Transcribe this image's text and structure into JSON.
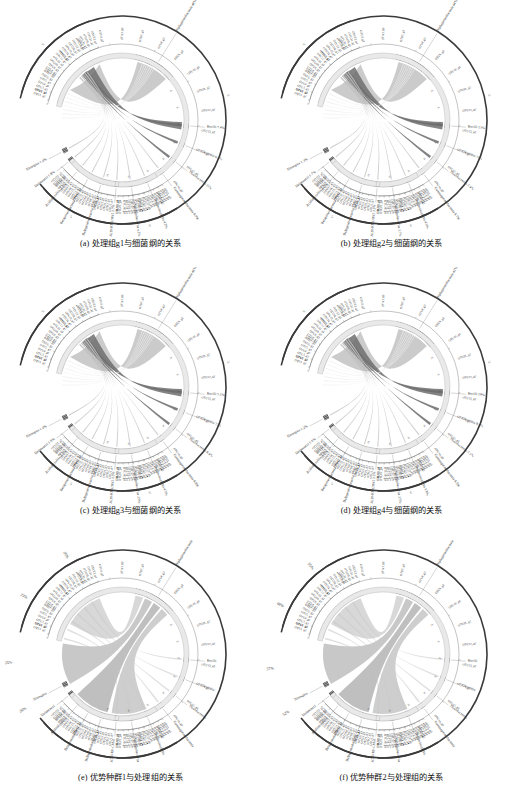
{
  "figure": {
    "title_present": false,
    "panel_count": 6
  },
  "panels": [
    {
      "id": "a",
      "caption": "(a) 处理组g1与细菌纲的关系",
      "outer_labels": [
        {
          "name": "Alphaproteobacteria",
          "pct": "48%",
          "text": "Alphaproteobacteria 48%",
          "angle": -58
        },
        {
          "name": "Bacilli",
          "pct": "7.4%",
          "text": "Bacilli 7.4%",
          "angle": 5
        },
        {
          "name": "Clostridia",
          "pct": "6.5%",
          "text": "Clostridia 6.5%",
          "angle": 22
        },
        {
          "name": "Flavobacteriia",
          "pct": "11%",
          "text": "Flavobacteriia 11%",
          "angle": 38
        },
        {
          "name": "Gammaproteobacteria",
          "pct": "4.9%",
          "text": "Gammaproteobacteria 4.9%",
          "angle": 53
        },
        {
          "name": "Thermoleophilia",
          "pct": "4.2%",
          "text": "Thermoleophilia 4.2%",
          "angle": 68
        },
        {
          "name": "Sphingobacteriia",
          "pct": "4.2%",
          "text": "Sphingobacteriia 4.2%",
          "angle": 82
        },
        {
          "name": "JG30_KF_CM45",
          "pct": "3.7%",
          "text": "JG30-KF-CM45 3.7%",
          "angle": 95
        },
        {
          "name": "Deltaproteobacteria",
          "pct": "3.1%",
          "text": "Deltaproteobacteria 3.1%",
          "angle": 108
        },
        {
          "name": "Betaproteobacteria",
          "pct": "2.2%",
          "text": "Betaproteobacteria 2.2%",
          "angle": 120
        },
        {
          "name": "Acidimicrobiia",
          "pct": "2.1%",
          "text": "Acidimicrobiia 2.1%",
          "angle": 131
        },
        {
          "name": "Deinococci",
          "pct": "1.8%",
          "text": "Deinococci 1.8%",
          "angle": 142
        },
        {
          "name": "Nitrospira",
          "pct": "1.4%",
          "text": "Nitrospira 1.4%",
          "angle": 152
        }
      ],
      "axis_ticks": [
        "2k",
        "4k",
        "6k",
        "8k",
        "0k",
        "2k",
        "4k",
        "6k"
      ],
      "sector_label": "g1",
      "highlight": "Alphaproteobacteria"
    },
    {
      "id": "b",
      "caption": "(b) 处理组g2与细菌纲的关系",
      "outer_labels": [
        {
          "name": "Alphaproteobacteria",
          "pct": "44%",
          "text": "Alphaproteobacteria 44%",
          "angle": -58
        },
        {
          "name": "Bacilli",
          "pct": "13%",
          "text": "Bacilli 13%",
          "angle": 5
        },
        {
          "name": "Clostridia",
          "pct": "10%",
          "text": "Clostridia 10%",
          "angle": 22
        },
        {
          "name": "Flavobacteriia",
          "pct": "7.4%",
          "text": "Flavobacteriia 7.4%",
          "angle": 38
        },
        {
          "name": "Gammaproteobacteria",
          "pct": "4.7%",
          "text": "Gammaproteobacteria 4.7%",
          "angle": 53
        },
        {
          "name": "Thermoleophilia",
          "pct": "4.0%",
          "text": "Thermoleophilia 4.0%",
          "angle": 68
        },
        {
          "name": "Sphingobacteriia",
          "pct": "3.7%",
          "text": "Sphingobacteriia 3.7%",
          "angle": 82
        },
        {
          "name": "JG30_KF_CM45",
          "pct": "3.2%",
          "text": "JG30-KF-CM45 3.2%",
          "angle": 95
        },
        {
          "name": "Deltaproteobacteria",
          "pct": "2.8%",
          "text": "Deltaproteobacteria 2.8%",
          "angle": 108
        },
        {
          "name": "Betaproteobacteria",
          "pct": "2.3%",
          "text": "Betaproteobacteria 2.3%",
          "angle": 120
        },
        {
          "name": "Acidimicrobiia",
          "pct": "2.0%",
          "text": "Acidimicrobiia 2.0%",
          "angle": 131
        },
        {
          "name": "Deinococci",
          "pct": "1.7%",
          "text": "Deinococci 1.7%",
          "angle": 142
        },
        {
          "name": "Nitrospira",
          "pct": "1.3%",
          "text": "Nitrospira 1.3%",
          "angle": 152
        }
      ],
      "axis_ticks": [
        "2k",
        "4k",
        "6k",
        "8k",
        "0k",
        "2k",
        "4k",
        "6k"
      ],
      "sector_label": "g2",
      "highlight": "Alphaproteobacteria"
    },
    {
      "id": "c",
      "caption": "(c) 处理组g3与细菌纲的关系",
      "outer_labels": [
        {
          "name": "Alphaproteobacteria",
          "pct": "46%",
          "text": "Alphaproteobacteria 46%",
          "angle": -58
        },
        {
          "name": "Bacilli",
          "pct": "5.1%",
          "text": "Bacilli 5.1%",
          "angle": 5
        },
        {
          "name": "Clostridia",
          "pct": "12%",
          "text": "Clostridia 12%",
          "angle": 22
        },
        {
          "name": "Flavobacteriia",
          "pct": "8.4%",
          "text": "Flavobacteriia 8.4%",
          "angle": 38
        },
        {
          "name": "Gammaproteobacteria",
          "pct": "4.8%",
          "text": "Gammaproteobacteria 4.8%",
          "angle": 53
        },
        {
          "name": "Thermoleophilia",
          "pct": "4.3%",
          "text": "Thermoleophilia 4.3%",
          "angle": 68
        },
        {
          "name": "Sphingobacteriia",
          "pct": "3.9%",
          "text": "Sphingobacteriia 3.9%",
          "angle": 82
        },
        {
          "name": "JG30_KF_CM45",
          "pct": "3.5%",
          "text": "JG30-KF-CM45 3.5%",
          "angle": 95
        },
        {
          "name": "Deltaproteobacteria",
          "pct": "3.0%",
          "text": "Deltaproteobacteria 3.0%",
          "angle": 108
        },
        {
          "name": "Betaproteobacteria",
          "pct": "2.4%",
          "text": "Betaproteobacteria 2.4%",
          "angle": 120
        },
        {
          "name": "Acidimicrobiia",
          "pct": "2.1%",
          "text": "Acidimicrobiia 2.1%",
          "angle": 131
        },
        {
          "name": "Deinococci",
          "pct": "1.9%",
          "text": "Deinococci 1.9%",
          "angle": 142
        },
        {
          "name": "Nitrospira",
          "pct": "1.4%",
          "text": "Nitrospira 1.4%",
          "angle": 152
        }
      ],
      "axis_ticks": [
        "2k",
        "4k",
        "6k",
        "8k",
        "0k",
        "2k",
        "4k",
        "6k"
      ],
      "sector_label": "g3",
      "highlight": "Alphaproteobacteria"
    },
    {
      "id": "d",
      "caption": "(d) 处理组g4与细菌纲的关系",
      "outer_labels": [
        {
          "name": "Alphaproteobacteria",
          "pct": "42%",
          "text": "Alphaproteobacteria 42%",
          "angle": -58
        },
        {
          "name": "Bacilli",
          "pct": "19%",
          "text": "Bacilli 19%",
          "angle": 5
        },
        {
          "name": "Clostridia",
          "pct": "8.4%",
          "text": "Clostridia 8.4%",
          "angle": 22
        },
        {
          "name": "Flavobacteriia",
          "pct": "7.1%",
          "text": "Flavobacteriia 7.1%",
          "angle": 38
        },
        {
          "name": "Gammaproteobacteria",
          "pct": "4.5%",
          "text": "Gammaproteobacteria 4.5%",
          "angle": 53
        },
        {
          "name": "Thermoleophilia",
          "pct": "3.8%",
          "text": "Thermoleophilia 3.8%",
          "angle": 68
        },
        {
          "name": "Sphingobacteriia",
          "pct": "3.5%",
          "text": "Sphingobacteriia 3.5%",
          "angle": 82
        },
        {
          "name": "JG30_KF_CM45",
          "pct": "3.1%",
          "text": "JG30-KF-CM45 3.1%",
          "angle": 95
        },
        {
          "name": "Deltaproteobacteria",
          "pct": "2.7%",
          "text": "Deltaproteobacteria 2.7%",
          "angle": 108
        },
        {
          "name": "Betaproteobacteria",
          "pct": "2.2%",
          "text": "Betaproteobacteria 2.2%",
          "angle": 120
        },
        {
          "name": "Acidimicrobiia",
          "pct": "1.9%",
          "text": "Acidimicrobiia 1.9%",
          "angle": 131
        },
        {
          "name": "Deinococci",
          "pct": "1.6%",
          "text": "Deinococci 1.6%",
          "angle": 142
        },
        {
          "name": "Nitrospira",
          "pct": "1.2%",
          "text": "Nitrospira 1.2%",
          "angle": 152
        }
      ],
      "axis_ticks": [
        "2k",
        "4k",
        "6k",
        "8k",
        "0k",
        "2k",
        "4k",
        "6k"
      ],
      "sector_label": "g4",
      "highlight": "Bacilli"
    },
    {
      "id": "e",
      "caption": "(e) 优势种群1与处理组的关系",
      "outer_labels": [
        {
          "name": "Alphaproteobacteria",
          "pct": "",
          "text": "Alphaproteobacteria",
          "angle": -58
        },
        {
          "name": "Bacilli",
          "pct": "",
          "text": "Bacilli",
          "angle": 5
        },
        {
          "name": "Clostridia",
          "pct": "",
          "text": "Clostridia",
          "angle": 22
        },
        {
          "name": "Flavobacteriia",
          "pct": "",
          "text": "Flavobacteriia",
          "angle": 38
        },
        {
          "name": "Gammaproteobacteria",
          "pct": "",
          "text": "Gammaproteobacteria",
          "angle": 53
        },
        {
          "name": "Thermoleophilia",
          "pct": "",
          "text": "Thermoleophilia",
          "angle": 68
        },
        {
          "name": "Sphingobacteriia",
          "pct": "",
          "text": "Sphingobacteriia",
          "angle": 82
        },
        {
          "name": "JG30_KF_CM45",
          "pct": "",
          "text": "JG30-KF-CM45",
          "angle": 95
        },
        {
          "name": "Deltaproteobacteria",
          "pct": "",
          "text": "Deltaproteobacteria",
          "angle": 108
        },
        {
          "name": "Betaproteobacteria",
          "pct": "",
          "text": "Betaproteobacteria",
          "angle": 120
        },
        {
          "name": "Acidimicrobiia",
          "pct": "",
          "text": "Acidimicrobiia",
          "angle": 131
        },
        {
          "name": "Deinococci",
          "pct": "",
          "text": "Deinococci",
          "angle": 142
        },
        {
          "name": "Nitrospira",
          "pct": "",
          "text": "Nitrospira",
          "angle": 152
        }
      ],
      "group_pcts": [
        {
          "label": "26%",
          "angle": -120
        },
        {
          "label": "23%",
          "angle": -150
        },
        {
          "label": "25%",
          "angle": 175
        },
        {
          "label": "26%",
          "angle": 150
        }
      ],
      "axis_ticks": [
        "2k",
        "4k",
        "6k",
        "8k",
        "0k",
        "2k",
        "4k",
        "6k"
      ],
      "sector_label": "",
      "highlight": "Alphaproteobacteria"
    },
    {
      "id": "f",
      "caption": "(f) 优势种群2与处理组的关系",
      "outer_labels": [
        {
          "name": "Alphaproteobacteria",
          "pct": "",
          "text": "Alphaproteobacteria",
          "angle": -58
        },
        {
          "name": "Bacilli",
          "pct": "",
          "text": "Bacilli",
          "angle": 5
        },
        {
          "name": "Clostridia",
          "pct": "",
          "text": "Clostridia",
          "angle": 22
        },
        {
          "name": "Flavobacteriia",
          "pct": "",
          "text": "Flavobacteriia",
          "angle": 38
        },
        {
          "name": "Gammaproteobacteria",
          "pct": "",
          "text": "Gammaproteobacteria",
          "angle": 53
        },
        {
          "name": "Thermoleophilia",
          "pct": "",
          "text": "Thermoleophilia",
          "angle": 68
        },
        {
          "name": "Sphingobacteriia",
          "pct": "",
          "text": "Sphingobacteriia",
          "angle": 82
        },
        {
          "name": "JG30_KF_CM45",
          "pct": "",
          "text": "JG30-KF-CM45",
          "angle": 95
        },
        {
          "name": "Deltaproteobacteria",
          "pct": "",
          "text": "Deltaproteobacteria",
          "angle": 108
        },
        {
          "name": "Betaproteobacteria",
          "pct": "",
          "text": "Betaproteobacteria",
          "angle": 120
        },
        {
          "name": "Acidimicrobiia",
          "pct": "",
          "text": "Acidimicrobiia",
          "angle": 131
        },
        {
          "name": "Deinococci",
          "pct": "",
          "text": "Deinococci",
          "angle": 142
        },
        {
          "name": "Nitrospira",
          "pct": "",
          "text": "Nitrospira",
          "angle": 152
        }
      ],
      "group_pcts": [
        {
          "label": "55%",
          "angle": -130
        },
        {
          "label": "60%",
          "angle": -155
        },
        {
          "label": "57%",
          "angle": 172
        },
        {
          "label": "52%",
          "angle": 148
        }
      ],
      "axis_ticks": [
        "2k",
        "4k",
        "6k",
        "8k",
        "0k",
        "2k",
        "4k",
        "6k"
      ],
      "sector_label": "",
      "highlight": "Alphaproteobacteria"
    }
  ],
  "chart_data": {
    "type": "chord",
    "title": "",
    "categories": [
      "Alphaproteobacteria",
      "Bacilli",
      "Clostridia",
      "Flavobacteriia",
      "Gammaproteobacteria",
      "Thermoleophilia",
      "Sphingobacteriia",
      "JG30-KF-CM45",
      "Deltaproteobacteria",
      "Betaproteobacteria",
      "Acidimicrobiia",
      "Deinococci",
      "Nitrospira"
    ],
    "series": [
      {
        "name": "g1",
        "values": [
          48,
          7.4,
          6.5,
          11,
          4.9,
          4.2,
          4.2,
          3.7,
          3.1,
          2.2,
          2.1,
          1.8,
          1.4
        ]
      },
      {
        "name": "g2",
        "values": [
          44,
          13,
          10,
          7.4,
          4.7,
          4.0,
          3.7,
          3.2,
          2.8,
          2.3,
          2.0,
          1.7,
          1.3
        ]
      },
      {
        "name": "g3",
        "values": [
          46,
          5.1,
          12,
          8.4,
          4.8,
          4.3,
          3.9,
          3.5,
          3.0,
          2.4,
          2.1,
          1.9,
          1.4
        ]
      },
      {
        "name": "g4",
        "values": [
          42,
          19,
          8.4,
          7.1,
          4.5,
          3.8,
          3.5,
          3.1,
          2.7,
          2.2,
          1.9,
          1.6,
          1.2
        ]
      }
    ],
    "xlabel": "",
    "ylabel": "",
    "legend_position": "none",
    "grid": false,
    "axis_unit": "k reads"
  }
}
